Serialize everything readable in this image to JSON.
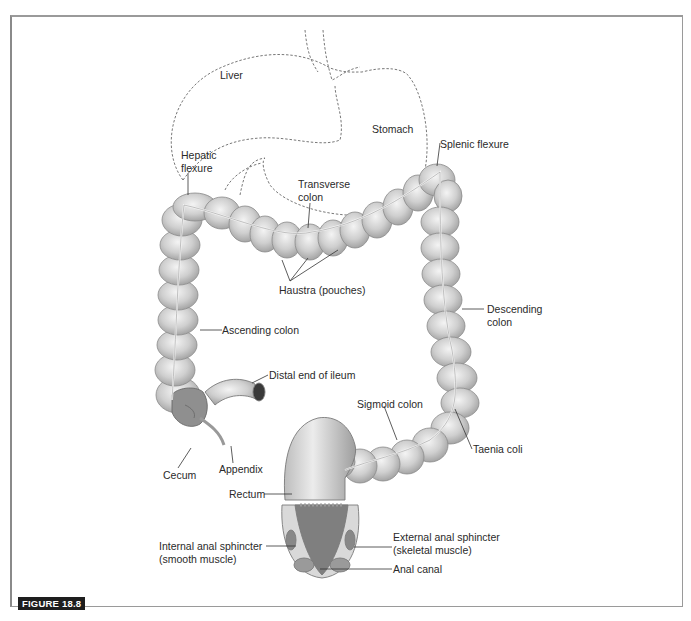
{
  "figure": {
    "label": "FIGURE 18.8",
    "label_bg": "#1e1e1e",
    "frame_color": "#9a9a9a"
  },
  "labels": {
    "liver": "Liver",
    "stomach": "Stomach",
    "hepatic_flexure": "Hepatic\nflexure",
    "splenic_flexure": "Splenic flexure",
    "transverse_colon": "Transverse\ncolon",
    "haustra": "Haustra (pouches)",
    "descending_colon": "Descending\ncolon",
    "ascending_colon": "Ascending colon",
    "distal_ileum": "Distal end of ileum",
    "sigmoid_colon": "Sigmoid colon",
    "taenia_coli": "Taenia coli",
    "cecum": "Cecum",
    "appendix": "Appendix",
    "rectum": "Rectum",
    "internal_sphincter": "Internal anal sphincter\n(smooth muscle)",
    "external_sphincter": "External anal sphincter\n(skeletal muscle)",
    "anal_canal": "Anal canal"
  },
  "colors": {
    "tissue_fill": "#d6d6d6",
    "tissue_shadow": "#a8a8a8",
    "tissue_highlight": "#f2f2f2",
    "outline": "#7a7a7a",
    "dashed_outline": "#555555",
    "leader_line": "#333333"
  }
}
